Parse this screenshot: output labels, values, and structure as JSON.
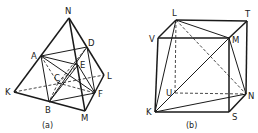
{
  "figures": [
    {
      "id": "a",
      "caption": "(a)",
      "points": {
        "N": [
          69,
          18
        ],
        "A": [
          41,
          56
        ],
        "D": [
          87,
          47
        ],
        "E": [
          78,
          65
        ],
        "L": [
          104,
          75
        ],
        "C": [
          58,
          83
        ],
        "K": [
          14,
          92
        ],
        "B": [
          49,
          102
        ],
        "F": [
          95,
          93
        ],
        "M": [
          85,
          111
        ]
      },
      "labels": [
        {
          "text": "N",
          "x": 65,
          "y": 14
        },
        {
          "text": "A",
          "x": 31,
          "y": 59
        },
        {
          "text": "D",
          "x": 88,
          "y": 46
        },
        {
          "text": "E",
          "x": 80,
          "y": 68
        },
        {
          "text": "L",
          "x": 107,
          "y": 79
        },
        {
          "text": "C",
          "x": 54,
          "y": 81
        },
        {
          "text": "K",
          "x": 5,
          "y": 95
        },
        {
          "text": "B",
          "x": 45,
          "y": 113
        },
        {
          "text": "F",
          "x": 98,
          "y": 97
        },
        {
          "text": "M",
          "x": 81,
          "y": 121
        }
      ],
      "thick": [
        [
          "N",
          "K"
        ],
        [
          "N",
          "M"
        ],
        [
          "N",
          "L"
        ],
        [
          "K",
          "M"
        ],
        [
          "M",
          "L"
        ]
      ],
      "solid": [
        [
          "A",
          "D"
        ],
        [
          "A",
          "E"
        ],
        [
          "A",
          "F"
        ],
        [
          "A",
          "B"
        ],
        [
          "D",
          "F"
        ],
        [
          "D",
          "B"
        ],
        [
          "E",
          "F"
        ],
        [
          "E",
          "B"
        ],
        [
          "B",
          "F"
        ]
      ],
      "dashed": [
        [
          "K",
          "L"
        ],
        [
          "A",
          "C"
        ],
        [
          "C",
          "E"
        ],
        [
          "C",
          "F"
        ],
        [
          "C",
          "B"
        ],
        [
          "C",
          "D"
        ]
      ]
    },
    {
      "id": "b",
      "caption": "(b)",
      "points": {
        "L": [
          176,
          20
        ],
        "T": [
          247,
          21
        ],
        "V": [
          158,
          38
        ],
        "M": [
          229,
          38
        ],
        "U": [
          175,
          93
        ],
        "N": [
          246,
          94
        ],
        "K": [
          155,
          112
        ],
        "S": [
          229,
          112
        ]
      },
      "labels": [
        {
          "text": "L",
          "x": 172,
          "y": 16
        },
        {
          "text": "T",
          "x": 245,
          "y": 17
        },
        {
          "text": "V",
          "x": 149,
          "y": 42
        },
        {
          "text": "M",
          "x": 232,
          "y": 43
        },
        {
          "text": "U",
          "x": 166,
          "y": 96
        },
        {
          "text": "N",
          "x": 248,
          "y": 99
        },
        {
          "text": "K",
          "x": 146,
          "y": 115
        },
        {
          "text": "S",
          "x": 232,
          "y": 120
        }
      ],
      "thick": [
        [
          "L",
          "T"
        ],
        [
          "T",
          "N"
        ],
        [
          "V",
          "M"
        ],
        [
          "M",
          "S"
        ],
        [
          "S",
          "K"
        ],
        [
          "K",
          "V"
        ],
        [
          "L",
          "V"
        ],
        [
          "T",
          "M"
        ],
        [
          "N",
          "S"
        ]
      ],
      "solid": [
        [
          "K",
          "L"
        ],
        [
          "K",
          "M"
        ],
        [
          "K",
          "N"
        ],
        [
          "L",
          "M"
        ],
        [
          "M",
          "N"
        ]
      ],
      "dashed": [
        [
          "L",
          "U"
        ],
        [
          "U",
          "N"
        ],
        [
          "L",
          "N"
        ]
      ]
    }
  ],
  "captions": {
    "a": "(a)",
    "b": "(b)"
  }
}
